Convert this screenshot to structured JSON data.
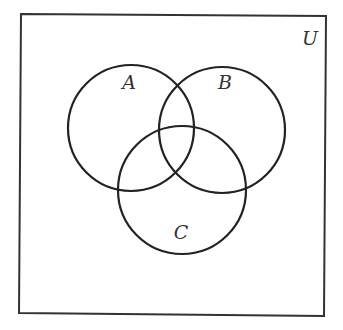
{
  "diagram": {
    "type": "venn-three-set",
    "universe": {
      "label": "U",
      "corners": {
        "top_left": [
          21,
          14
        ],
        "top_right": [
          326,
          16
        ],
        "bottom_right": [
          324,
          316
        ],
        "bottom_left": [
          19,
          313
        ]
      },
      "label_pos": [
        310,
        45
      ],
      "stroke": "#333333"
    },
    "sets": [
      {
        "id": "A",
        "label": "A",
        "cx": 131,
        "cy": 128,
        "r": 63,
        "label_pos": [
          129,
          89
        ]
      },
      {
        "id": "B",
        "label": "B",
        "cx": 222,
        "cy": 130,
        "r": 63,
        "label_pos": [
          225,
          89
        ]
      },
      {
        "id": "C",
        "label": "C",
        "cx": 182,
        "cy": 190,
        "r": 64,
        "label_pos": [
          181,
          239
        ]
      }
    ],
    "stroke_color": "#222222",
    "label_color": "#333333",
    "background": "#ffffff"
  }
}
